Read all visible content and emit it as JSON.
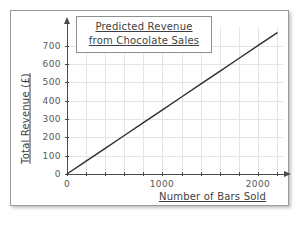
{
  "chart_data": {
    "type": "line",
    "title": "Predicted Revenue from Chocolate Sales",
    "title_lines": [
      "Predicted Revenue",
      "from Chocolate Sales"
    ],
    "xlabel": "Number of Bars Sold",
    "ylabel": "Total Revenue (£)",
    "xlim": [
      0,
      2200
    ],
    "ylim": [
      0,
      780
    ],
    "grid": true,
    "legend": "none",
    "x_major_ticks": [
      0,
      1000,
      2000
    ],
    "x_major_tick_labels": [
      "0",
      "1000",
      "2000"
    ],
    "x_minor_tick_interval": 200,
    "y_major_ticks": [
      0,
      100,
      200,
      300,
      400,
      500,
      600,
      700
    ],
    "y_major_tick_labels": [
      "0",
      "100",
      "200",
      "300",
      "400",
      "500",
      "600",
      "700"
    ],
    "series": [
      {
        "name": "Predicted revenue",
        "color": "#2f2f2f",
        "slope_pounds_per_bar": 0.35,
        "x": [
          0,
          2200
        ],
        "values": [
          0,
          770
        ],
        "points": [
          {
            "x": 0,
            "y": 0
          },
          {
            "x": 200,
            "y": 70
          },
          {
            "x": 400,
            "y": 140
          },
          {
            "x": 600,
            "y": 210
          },
          {
            "x": 800,
            "y": 280
          },
          {
            "x": 1000,
            "y": 350
          },
          {
            "x": 1200,
            "y": 420
          },
          {
            "x": 1400,
            "y": 490
          },
          {
            "x": 1600,
            "y": 560
          },
          {
            "x": 1800,
            "y": 630
          },
          {
            "x": 2000,
            "y": 700
          },
          {
            "x": 2200,
            "y": 770
          }
        ]
      }
    ]
  },
  "style": {
    "line_color": "#2f2f2f",
    "axis_color": "#4a4a4a",
    "grid_color": "#e2e4e6",
    "text_color": "#3d3f42",
    "ticklabel_color": "#57595c",
    "panel_border_color": "#9a9a9a",
    "title_box_border_color": "#8d8f91",
    "background": "#ffffff"
  },
  "icons": {
    "y_axis_arrow": "arrow-up-icon",
    "x_axis_arrow": "arrow-right-icon"
  }
}
